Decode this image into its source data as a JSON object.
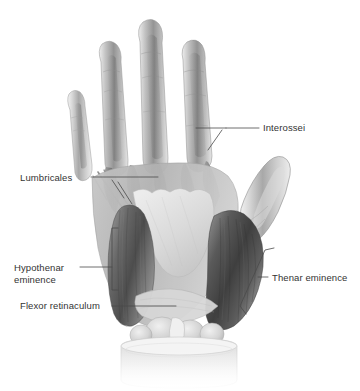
{
  "figure": {
    "background_color": "#ffffff",
    "width": 360,
    "height": 391,
    "style": "grayscale anatomical illustration"
  },
  "labels": {
    "interossei": {
      "text": "Interossei",
      "x": 263,
      "y": 131,
      "anchor": "start"
    },
    "lumbricales": {
      "text": "Lumbricales",
      "x": 20,
      "y": 181,
      "anchor": "start"
    },
    "hypothenar_line1": {
      "text": "Hypothenar",
      "x": 14,
      "y": 271,
      "anchor": "start"
    },
    "hypothenar_line2": {
      "text": "eminence",
      "x": 14,
      "y": 283,
      "anchor": "start"
    },
    "flexor_retinaculum": {
      "text": "Flexor retinaculum",
      "x": 20,
      "y": 309,
      "anchor": "start"
    },
    "thenar_eminence": {
      "text": "Thenar eminence",
      "x": 272,
      "y": 281,
      "anchor": "start"
    }
  },
  "colors": {
    "text": "#333333",
    "leader_line": "#4a4a4a",
    "background": "#ffffff",
    "muscle_dark": "#4b4b4b",
    "muscle_mid": "#8a8a8a",
    "muscle_light": "#c9c9c9",
    "aponeurosis": "#dcdcdc",
    "bone_light": "#e8e8e8",
    "tendon": "#9e9e9e"
  },
  "anatomy_parts": [
    "index finger",
    "middle finger",
    "ring finger",
    "little finger",
    "thumb",
    "palmar aponeurosis",
    "thenar muscle group",
    "hypothenar muscle group",
    "interosseous muscles",
    "lumbrical muscles",
    "flexor retinaculum",
    "wrist cross-section"
  ]
}
